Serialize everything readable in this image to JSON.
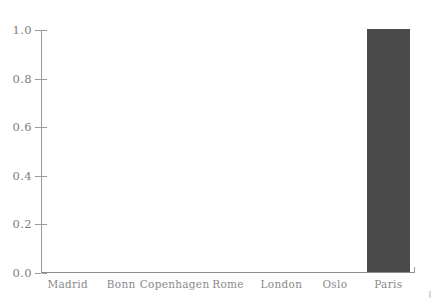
{
  "chart_data": {
    "type": "bar",
    "title": "",
    "subtitle": "",
    "xlabel": "",
    "ylabel": "",
    "categories": [
      "Madrid",
      "Bonn",
      "Copenhagen",
      "Rome",
      "London",
      "Oslo",
      "Paris"
    ],
    "values": [
      0.0,
      0.0,
      0.0,
      0.0,
      0.0,
      0.0,
      1.0
    ],
    "ylim": [
      0.0,
      1.0
    ],
    "yticks": [
      "0.0",
      "0.2",
      "0.4",
      "0.6",
      "0.8",
      "1.0"
    ],
    "ytick_values": [
      0.0,
      0.2,
      0.4,
      0.6,
      0.8,
      1.0
    ],
    "grid": false,
    "legend": null,
    "legend_position": "none",
    "annotations": [],
    "bar_color": "#4a4a4a",
    "axis_color": "#9a9a9a",
    "tick_label_color": "#828282",
    "background_color": "#ffffff"
  }
}
